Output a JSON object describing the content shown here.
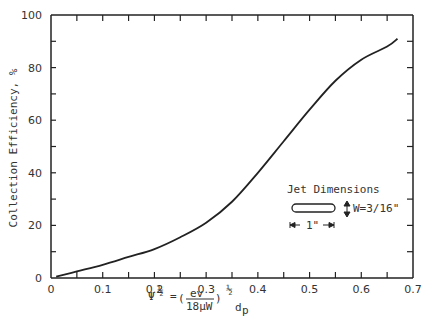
{
  "chart_data": {
    "type": "line",
    "title": "",
    "xlabel": "Ψ^½ = (ev / 18μW)^½ d_p",
    "ylabel": "Collection Efficiency, %",
    "xlim": [
      0,
      0.7
    ],
    "ylim": [
      0,
      100
    ],
    "x_ticks": [
      "0",
      "0.1",
      "0.2",
      "0.3",
      "0.4",
      "0.5",
      "0.6",
      "0.7"
    ],
    "y_ticks": [
      "0",
      "20",
      "40",
      "60",
      "80",
      "100"
    ],
    "grid": false,
    "series": [
      {
        "name": "Collection Efficiency",
        "x": [
          0.01,
          0.05,
          0.1,
          0.15,
          0.2,
          0.25,
          0.3,
          0.35,
          0.4,
          0.45,
          0.5,
          0.55,
          0.6,
          0.65,
          0.67
        ],
        "y": [
          0.5,
          2.5,
          5,
          8,
          11,
          15.5,
          21,
          29,
          40,
          52,
          64,
          75,
          83,
          88,
          91
        ]
      }
    ],
    "annotations": [
      {
        "text": "Jet Dimensions"
      },
      {
        "text": "W=3/16\""
      },
      {
        "text": "1\""
      }
    ]
  },
  "axes": {
    "ylabel": "Collection Efficiency, %",
    "xlabel_psi": "Ψ",
    "xlabel_half": "½",
    "xlabel_eq": "=",
    "xlabel_num": "ev",
    "xlabel_den": "18μW",
    "xlabel_dp": "d",
    "xlabel_sub": "p",
    "x_ticks": [
      "0",
      "0.1",
      "0.2",
      "0.3",
      "0.4",
      "0.5",
      "0.6",
      "0.7"
    ],
    "y_ticks": [
      "0",
      "20",
      "40",
      "60",
      "80",
      "100"
    ]
  },
  "legend": {
    "title": "Jet Dimensions",
    "width_label": "W=3/16\"",
    "length_label": "1\""
  }
}
